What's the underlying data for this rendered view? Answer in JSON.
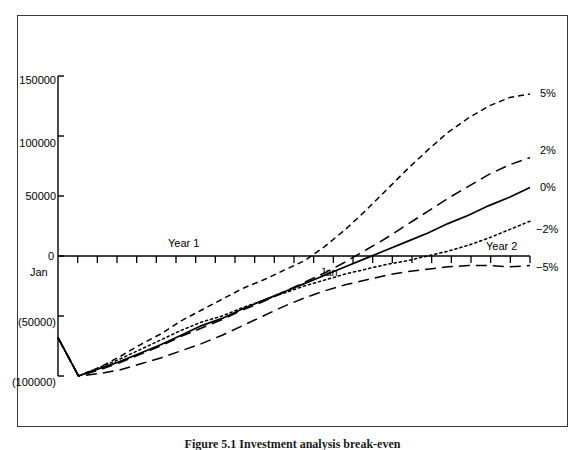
{
  "figure": {
    "caption": "Figure 5.1 Investment analysis break-even"
  },
  "chart_data": {
    "type": "line",
    "title": "",
    "xlabel": "",
    "ylabel": "",
    "xlim": [
      0,
      24
    ],
    "ylim": [
      -100000,
      150000
    ],
    "grid": false,
    "legend_position": "right-of-plot-end",
    "y_ticks": [
      {
        "label": "150000",
        "value": 150000
      },
      {
        "label": "100000",
        "value": 100000
      },
      {
        "label": "50000",
        "value": 50000
      },
      {
        "label": "0",
        "value": 0
      },
      {
        "label": "(50000)",
        "value": -50000
      },
      {
        "label": "(100000)",
        "value": -100000
      }
    ],
    "x_tick_count": 24,
    "x_annotations": [
      {
        "label": "Jan",
        "x": 0
      },
      {
        "label": "Jan",
        "x": 12
      }
    ],
    "period_annotations": [
      {
        "label": "Year 1",
        "x": 6
      },
      {
        "label": "Year 2",
        "x": 19
      }
    ],
    "series": [
      {
        "name": "5%",
        "style": "dashed",
        "label": "5%",
        "values": [
          -68000,
          -100000,
          -93000,
          -84000,
          -74000,
          -65000,
          -54000,
          -45000,
          -36000,
          -27000,
          -20000,
          -12000,
          -4000,
          8000,
          22000,
          38000,
          55000,
          72000,
          88000,
          103000,
          115000,
          125000,
          132000,
          135000
        ]
      },
      {
        "name": "2%",
        "style": "long-dash",
        "label": "2%",
        "values": [
          -68000,
          -100000,
          -95000,
          -89000,
          -82000,
          -75000,
          -67000,
          -60000,
          -53000,
          -45000,
          -38000,
          -30000,
          -22000,
          -14000,
          -5000,
          5000,
          15000,
          26000,
          37000,
          48000,
          58000,
          68000,
          76000,
          82000
        ]
      },
      {
        "name": "0%",
        "style": "solid",
        "label": "0%",
        "values": [
          -68000,
          -100000,
          -94000,
          -88000,
          -81000,
          -74000,
          -66000,
          -58000,
          -52000,
          -44000,
          -37000,
          -30000,
          -23000,
          -16000,
          -9000,
          -2000,
          5000,
          12000,
          19000,
          27000,
          34000,
          42000,
          49000,
          57000
        ]
      },
      {
        "name": "-2%",
        "style": "dotted",
        "label": "−2%",
        "values": [
          -68000,
          -100000,
          -93000,
          -86000,
          -78000,
          -70000,
          -62000,
          -55000,
          -50000,
          -43000,
          -37000,
          -31000,
          -25000,
          -20000,
          -15000,
          -11000,
          -7000,
          -4000,
          0,
          4000,
          9000,
          15000,
          22000,
          29000
        ]
      },
      {
        "name": "-5%",
        "style": "long-dash",
        "label": "−5%",
        "values": [
          -68000,
          -100000,
          -98000,
          -95000,
          -90000,
          -85000,
          -79000,
          -73000,
          -66000,
          -58000,
          -50000,
          -42000,
          -35000,
          -29000,
          -24000,
          -20000,
          -16000,
          -13000,
          -11000,
          -9000,
          -8000,
          -8000,
          -9000,
          -8000
        ]
      }
    ]
  }
}
